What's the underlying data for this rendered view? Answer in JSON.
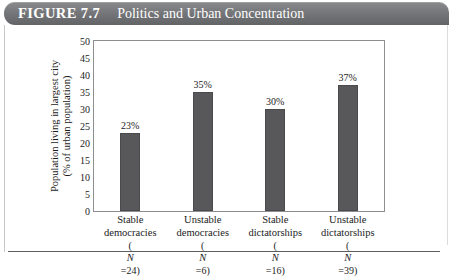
{
  "header": {
    "figure_label": "FIGURE 7.7",
    "title": "Politics and Urban Concentration"
  },
  "chart_data": {
    "type": "bar",
    "title": "Politics and Urban Concentration",
    "xlabel": "",
    "ylabel": "Population living in largest city (% of urban population)",
    "ylabel_line1": "Population living in largest city",
    "ylabel_line2": "(% of urban population)",
    "ylim": [
      0,
      50
    ],
    "ytick_step": 5,
    "yticks": [
      0,
      5,
      10,
      15,
      20,
      25,
      30,
      35,
      40,
      45,
      50
    ],
    "ytick_labels": [
      "0",
      "5",
      "10",
      "15",
      "20",
      "25",
      "30",
      "35",
      "40",
      "45",
      "50"
    ],
    "grid": false,
    "legend": "none",
    "bar_color": "#58585a",
    "categories": [
      "Stable democracies",
      "Unstable democracies",
      "Stable dictatorships",
      "Unstable dictatorships"
    ],
    "category_lines": [
      [
        "Stable",
        "democracies"
      ],
      [
        "Unstable",
        "democracies"
      ],
      [
        "Stable",
        "dictatorships"
      ],
      [
        "Unstable",
        "dictatorships"
      ]
    ],
    "n_labels": [
      "(N=24)",
      "(N=6)",
      "(N=16)",
      "(N=39)"
    ],
    "n_values": [
      24,
      6,
      16,
      39
    ],
    "values": [
      23,
      35,
      30,
      37
    ],
    "value_labels": [
      "23%",
      "35%",
      "30%",
      "37%"
    ]
  }
}
